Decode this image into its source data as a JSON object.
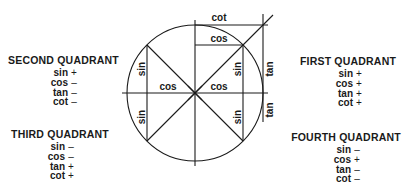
{
  "quadrants": {
    "first": {
      "title": "FIRST QUADRANT",
      "rows": [
        {
          "fn": "sin",
          "sign": "+"
        },
        {
          "fn": "cos",
          "sign": "+"
        },
        {
          "fn": "tan",
          "sign": "+"
        },
        {
          "fn": "cot",
          "sign": "+"
        }
      ]
    },
    "second": {
      "title": "SECOND QUADRANT",
      "rows": [
        {
          "fn": "sin",
          "sign": "+"
        },
        {
          "fn": "cos",
          "sign": "–"
        },
        {
          "fn": "tan",
          "sign": "–"
        },
        {
          "fn": "cot",
          "sign": "–"
        }
      ]
    },
    "third": {
      "title": "THIRD QUADRANT",
      "rows": [
        {
          "fn": "sin",
          "sign": "–"
        },
        {
          "fn": "cos",
          "sign": "–"
        },
        {
          "fn": "tan",
          "sign": "+"
        },
        {
          "fn": "cot",
          "sign": "+"
        }
      ]
    },
    "fourth": {
      "title": "FOURTH QUADRANT",
      "rows": [
        {
          "fn": "sin",
          "sign": "–"
        },
        {
          "fn": "cos",
          "sign": "+"
        },
        {
          "fn": "tan",
          "sign": "–"
        },
        {
          "fn": "cot",
          "sign": "–"
        }
      ]
    }
  },
  "circle_labels": {
    "cot_top": "cot",
    "cos_top": "cos",
    "cos_left": "cos",
    "cos_right": "cos",
    "sin_upper_left": "sin",
    "sin_lower_left": "sin",
    "sin_upper_right": "sin",
    "sin_lower_right": "sin",
    "tan_upper": "tan",
    "tan_lower": "tan"
  },
  "colors": {
    "ink": "#1a1a1a",
    "background": "#ffffff"
  }
}
